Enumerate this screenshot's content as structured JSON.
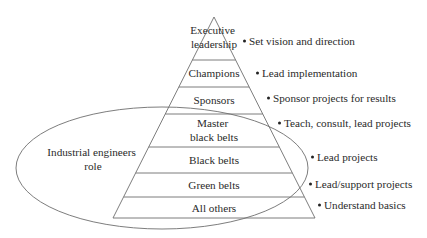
{
  "diagram": {
    "type": "pyramid",
    "colors": {
      "line": "#6e6e6e",
      "text": "#2a2a2a",
      "background": "#ffffff"
    },
    "tiers": [
      {
        "label_lines": [
          "Executive",
          "leadership"
        ],
        "role": "Set vision and direction"
      },
      {
        "label_lines": [
          "Champions"
        ],
        "role": "Lead implementation"
      },
      {
        "label_lines": [
          "Sponsors"
        ],
        "role": "Sponsor projects for results"
      },
      {
        "label_lines": [
          "Master",
          "black belts"
        ],
        "role": "Teach, consult, lead projects"
      },
      {
        "label_lines": [
          "Black belts"
        ],
        "role": "Lead projects"
      },
      {
        "label_lines": [
          "Green belts"
        ],
        "role": "Lead/support projects"
      },
      {
        "label_lines": [
          "All others"
        ],
        "role": "Understand basics"
      }
    ],
    "oval": {
      "label_lines": [
        "Industrial engineers",
        "role"
      ],
      "encloses_tiers": [
        "Master black belts",
        "Black belts",
        "Green belts",
        "All others"
      ]
    }
  }
}
